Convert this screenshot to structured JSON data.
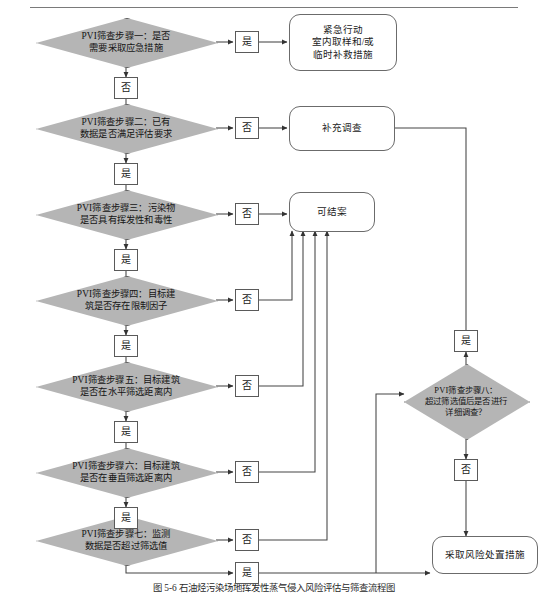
{
  "figure": {
    "caption": "图 5-6  石油烃污染场地挥发性蒸气侵入风险评估与筛查流程图",
    "rule_color": "#7a7a7a",
    "diamond_fill": "#b5b5b5",
    "line_color": "#444444"
  },
  "labels": {
    "yes": "是",
    "no": "否"
  },
  "steps": [
    {
      "id": "step1",
      "text": "PVI筛查步骤一：是否\n需要采取应急措施"
    },
    {
      "id": "step2",
      "text": "PVI筛查步骤二：已有\n数据是否满足评估要求"
    },
    {
      "id": "step3",
      "text": "PVI筛查步骤三：污染物\n是否具有挥发性和毒性"
    },
    {
      "id": "step4",
      "text": "PVI筛查步骤四：目标建\n筑是否存在限制因子"
    },
    {
      "id": "step5",
      "text": "PVI筛查步骤五：目标建筑\n是否在水平筛选距离内"
    },
    {
      "id": "step6",
      "text": "PVI筛查步骤六：目标建筑\n是否在垂直筛选距离内"
    },
    {
      "id": "step7",
      "text": "PVI筛查步骤七：监测\n数据是否超过筛选值"
    },
    {
      "id": "step8",
      "text": "PVI筛查步骤八：\n超过筛选值后是否进行\n详细调查？"
    }
  ],
  "terminals": [
    {
      "id": "emergency",
      "text": "紧急行动\n室内取样和/或\n临时补救措施"
    },
    {
      "id": "supplementary",
      "text": "补充调查"
    },
    {
      "id": "close_case",
      "text": "可结案"
    },
    {
      "id": "risk_measures",
      "text": "采取风险处置措施"
    }
  ],
  "connector_labels": {
    "s1_yes": "是",
    "s1_no": "否",
    "s2_no": "否",
    "s2_yes": "是",
    "s3_no": "否",
    "s3_yes": "是",
    "s4_no": "否",
    "s4_yes": "是",
    "s5_no": "否",
    "s5_yes": "是",
    "s6_no": "否",
    "s6_yes": "是",
    "s7_no": "否",
    "s7_yes": "是",
    "s8_yes": "是",
    "s8_no": "否"
  }
}
